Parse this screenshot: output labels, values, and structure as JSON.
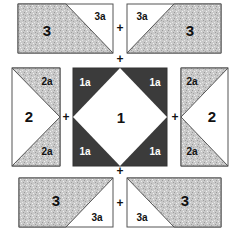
{
  "colors": {
    "print_fill": "#c9c9c9",
    "dark_fill": "#3b3b3b",
    "light_fill": "#ffffff",
    "outline": "#555555"
  },
  "pieces": {
    "top_left": {
      "large_label": "3",
      "small_label": "3a"
    },
    "top_right": {
      "large_label": "3",
      "small_label": "3a"
    },
    "middle_left": {
      "large_label": "2",
      "top_label": "2a",
      "bottom_label": "2a"
    },
    "center": {
      "large_label": "1",
      "corner_labels": [
        "1a",
        "1a",
        "1a",
        "1a"
      ]
    },
    "middle_right": {
      "large_label": "2",
      "top_label": "2a",
      "bottom_label": "2a"
    },
    "bottom_left": {
      "large_label": "3",
      "small_label": "3a"
    },
    "bottom_right": {
      "large_label": "3",
      "small_label": "3a"
    }
  },
  "joins": {
    "top_row": "+",
    "top_to_middle": "+",
    "middle_left": "+",
    "middle_right": "+",
    "middle_to_bottom": "+",
    "bottom_row": "+"
  }
}
